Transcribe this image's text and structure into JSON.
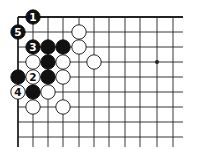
{
  "diagram": {
    "type": "go-board-fragment",
    "grid": {
      "x_lines": [
        18,
        33,
        48,
        63,
        79,
        94,
        109,
        125,
        140,
        157,
        173
      ],
      "y_lines": [
        17,
        32,
        47,
        62,
        77,
        92,
        107,
        122,
        137
      ],
      "h_line_end_x": 183,
      "v_line_end_y": 147,
      "top_edge": true,
      "left_edge": true
    },
    "star_points": [
      {
        "col": 9,
        "row": 3
      }
    ],
    "stones": [
      {
        "color": "black",
        "col": 1,
        "row": 0,
        "label": "1"
      },
      {
        "color": "black",
        "col": 0,
        "row": 1,
        "label": "5"
      },
      {
        "color": "white",
        "col": 4,
        "row": 1,
        "label": ""
      },
      {
        "color": "black",
        "col": 1,
        "row": 2,
        "label": "3"
      },
      {
        "color": "black",
        "col": 2,
        "row": 2,
        "label": ""
      },
      {
        "color": "black",
        "col": 3,
        "row": 2,
        "label": ""
      },
      {
        "color": "white",
        "col": 4,
        "row": 2,
        "label": ""
      },
      {
        "color": "white",
        "col": 1,
        "row": 3,
        "label": ""
      },
      {
        "color": "black",
        "col": 2,
        "row": 3,
        "label": ""
      },
      {
        "color": "white",
        "col": 3,
        "row": 3,
        "label": ""
      },
      {
        "color": "white",
        "col": 5,
        "row": 3,
        "label": ""
      },
      {
        "color": "black",
        "col": 0,
        "row": 4,
        "label": ""
      },
      {
        "color": "white",
        "col": 1,
        "row": 4,
        "label": "2"
      },
      {
        "color": "black",
        "col": 2,
        "row": 4,
        "label": ""
      },
      {
        "color": "white",
        "col": 3,
        "row": 4,
        "label": ""
      },
      {
        "color": "white",
        "col": 0,
        "row": 5,
        "label": "4"
      },
      {
        "color": "black",
        "col": 1,
        "row": 5,
        "label": ""
      },
      {
        "color": "white",
        "col": 2,
        "row": 5,
        "label": ""
      },
      {
        "color": "white",
        "col": 1,
        "row": 6,
        "label": ""
      },
      {
        "color": "white",
        "col": 3,
        "row": 6,
        "label": ""
      }
    ],
    "colors": {
      "line": "#222222",
      "black_stone": "#111111",
      "white_stone": "#ffffff",
      "background": "#ffffff"
    }
  }
}
